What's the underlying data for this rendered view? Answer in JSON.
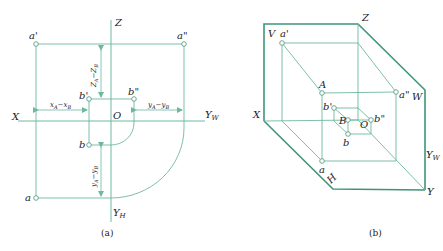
{
  "figure": {
    "panel_a": {
      "caption": "(a)",
      "axes": {
        "z": "Z",
        "x": "X",
        "yw": "Y",
        "yw_sub": "W",
        "yh": "Y",
        "yh_sub": "H",
        "origin": "O"
      },
      "points": {
        "a_prime": "a'",
        "a_double_prime": "a\"",
        "b_prime": "b'",
        "b_double_prime": "b\"",
        "b": "b",
        "a": "a"
      },
      "dimensions": {
        "z_diff": "Z",
        "z_diff_full": "ZA−ZB",
        "x_diff": "xA−xB",
        "y_diff_w": "yA−yB",
        "y_diff_h": "yA−yB"
      }
    },
    "panel_b": {
      "caption": "(b)",
      "planes": {
        "v": "V",
        "w": "W",
        "h": "H"
      },
      "axes": {
        "z": "Z",
        "x": "X",
        "yw": "Y",
        "yw_sub": "W",
        "y": "Y",
        "origin": "O"
      },
      "points": {
        "a_prime": "a'",
        "A": "A",
        "a_double_prime": "a\"",
        "b_prime": "b'",
        "B": "B",
        "b_double_prime": "b\"",
        "b": "b",
        "a": "a"
      }
    },
    "colors": {
      "line": "#6fb8a0",
      "frame": "#3f9578",
      "text": "#222222"
    }
  }
}
